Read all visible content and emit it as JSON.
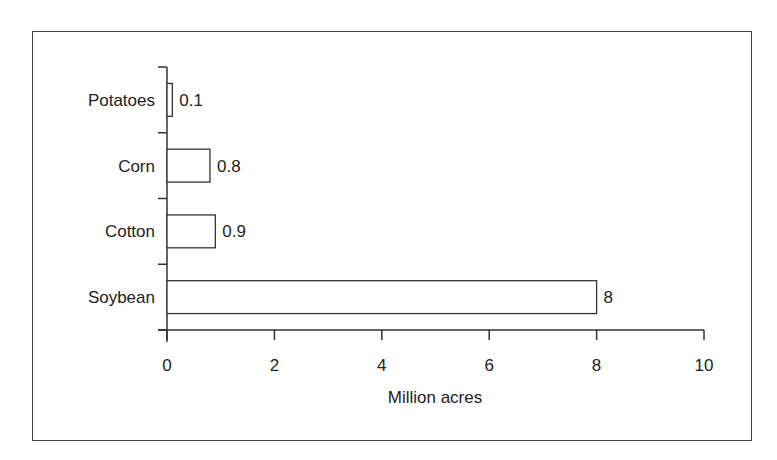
{
  "chart_data": {
    "type": "bar",
    "orientation": "horizontal",
    "title": "",
    "xlabel": "Million acres",
    "ylabel": "",
    "categories": [
      "Potatoes",
      "Corn",
      "Cotton",
      "Soybean"
    ],
    "values": [
      0.1,
      0.8,
      0.9,
      8
    ],
    "value_labels": [
      "0.1",
      "0.8",
      "0.9",
      "8"
    ],
    "xlim": [
      0,
      10
    ],
    "xticks": [
      0,
      2,
      4,
      6,
      8,
      10
    ],
    "xtick_labels": [
      "0",
      "2",
      "4",
      "6",
      "8",
      "10"
    ],
    "grid": false,
    "legend": null,
    "bar_fill": "#ffffff",
    "bar_stroke": "#333333"
  }
}
